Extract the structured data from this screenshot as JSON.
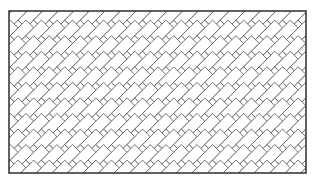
{
  "figure": {
    "canvas": {
      "width": 316,
      "height": 185,
      "background": "#ffffff"
    },
    "frame": {
      "name": "panel-border",
      "x": 9,
      "y": 11,
      "width": 297,
      "height": 162,
      "stroke": "#3a3a3a",
      "stroke_width": 1.6,
      "fill": "#ffffff"
    },
    "pattern": {
      "type": "herringbone",
      "brick_length": 22,
      "brick_width": 11,
      "angle_degrees": 45,
      "module": 22,
      "stroke": "#606060",
      "stroke_width": 0.9,
      "fill": "#ffffff",
      "columns": 20,
      "rows": 12
    }
  }
}
